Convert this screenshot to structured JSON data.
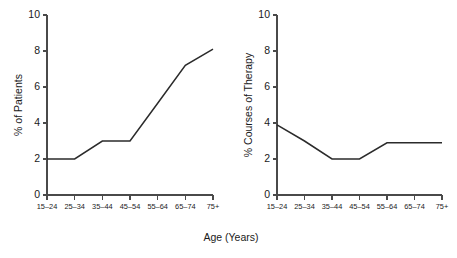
{
  "figure": {
    "width": 457,
    "height": 258,
    "background": "#ffffff",
    "line_color": "#2b2b2b",
    "axis_color": "#4a4a4a",
    "shared_xlabel": "Age (Years)"
  },
  "chart_data": [
    {
      "type": "line",
      "id": "left",
      "title": "",
      "xlabel": "Age (Years)",
      "ylabel": "% of Patients",
      "categories": [
        "15–24",
        "25–34",
        "35–44",
        "45–54",
        "55–64",
        "65–74",
        "75+"
      ],
      "values": [
        2.0,
        2.0,
        3.0,
        3.0,
        5.1,
        7.2,
        8.1
      ],
      "ylim": [
        0,
        10
      ],
      "yticks": [
        0,
        2,
        4,
        6,
        8,
        10
      ],
      "ytick_labels": [
        "0",
        "2",
        "4",
        "6",
        "8",
        "10"
      ],
      "grid": false,
      "legend": "none"
    },
    {
      "type": "line",
      "id": "right",
      "title": "",
      "xlabel": "(Years)",
      "ylabel": "% Courses of Therapy",
      "categories": [
        "15–24",
        "25–34",
        "35–44",
        "45–54",
        "55–64",
        "65–74",
        "75+"
      ],
      "values": [
        3.9,
        3.0,
        2.0,
        2.0,
        2.9,
        2.9,
        2.9
      ],
      "ylim": [
        0,
        10
      ],
      "yticks": [
        0,
        2,
        4,
        6,
        8,
        10
      ],
      "ytick_labels": [
        "0",
        "2",
        "4",
        "6",
        "8",
        "10"
      ],
      "grid": false,
      "legend": "none"
    }
  ]
}
